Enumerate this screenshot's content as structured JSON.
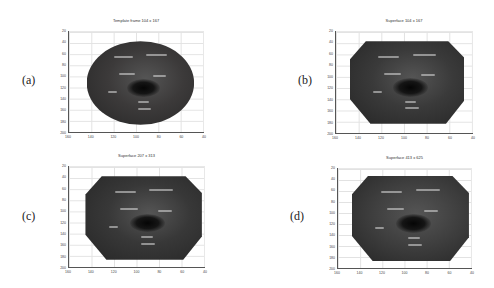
{
  "figure": {
    "panels": [
      {
        "label": "(a)",
        "title": "Template frame 104 x 167"
      },
      {
        "label": "(b)",
        "title": "Superface 104 x 167"
      },
      {
        "label": "(c)",
        "title": "Superface 207 x 313"
      },
      {
        "label": "(d)",
        "title": "Superface 413 x 625"
      }
    ],
    "axes": {
      "yticks": [
        "20",
        "40",
        "60",
        "80",
        "100",
        "120",
        "140",
        "160",
        "180",
        "200"
      ],
      "xticks": [
        "160",
        "140",
        "120",
        "100",
        "80",
        "60",
        "40"
      ]
    },
    "colors": {
      "surface": "#3a3a3a",
      "grid": "#e2e2e2",
      "axis": "#555555"
    }
  }
}
